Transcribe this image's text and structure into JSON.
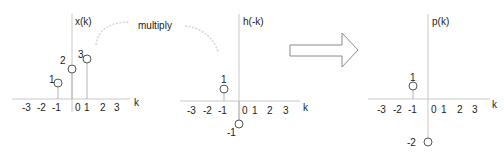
{
  "annotation": {
    "operation_label": "multiply"
  },
  "panels": [
    {
      "title": "x(k)",
      "axis_label": "k",
      "ticks": [
        "-3",
        "-2",
        "-1",
        "0",
        "1",
        "2",
        "3"
      ],
      "samples": [
        {
          "k": -1,
          "value": 1,
          "label": "1"
        },
        {
          "k": 0,
          "value": 2,
          "label": "2"
        },
        {
          "k": 1,
          "value": 3,
          "label": "3"
        }
      ]
    },
    {
      "title": "h(-k)",
      "axis_label": "k",
      "ticks": [
        "-3",
        "-2",
        "-1",
        "0",
        "1",
        "2",
        "3"
      ],
      "samples": [
        {
          "k": -1,
          "value": 1,
          "label": "1"
        },
        {
          "k": 0,
          "value": -1,
          "label": "-1"
        }
      ]
    },
    {
      "title": "p(k)",
      "axis_label": "k",
      "ticks": [
        "-3",
        "-2",
        "-1",
        "0",
        "1",
        "2",
        "3"
      ],
      "samples": [
        {
          "k": -1,
          "value": 1,
          "label": "1"
        },
        {
          "k": 0,
          "value": -2,
          "label": "-2"
        }
      ]
    }
  ],
  "colors": {
    "axis": "#c8c8c8",
    "marker": "#555555",
    "text": "#222222"
  }
}
